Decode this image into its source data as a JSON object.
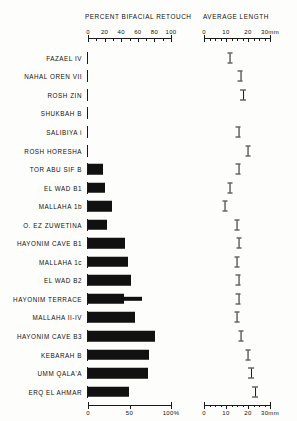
{
  "figure": {
    "left_panel_title": "PERCENT BIFACIAL RETOUCH",
    "right_panel_title": "AVERAGE LENGTH"
  },
  "chart_data": {
    "type": "bar",
    "title": "",
    "panels": [
      {
        "name": "percent-bifacial-retouch",
        "title": "PERCENT BIFACIAL RETOUCH",
        "xlabel": "",
        "xlim": [
          0,
          100
        ],
        "top_axis_ticks": [
          "0",
          "20",
          "40",
          "60",
          "80",
          "100"
        ],
        "top_axis_values": [
          0,
          20,
          40,
          60,
          80,
          100
        ],
        "bottom_axis_ticks": [
          "0",
          "50",
          "100%"
        ],
        "bottom_axis_values": [
          0,
          50,
          100
        ],
        "grid": false
      },
      {
        "name": "average-length",
        "title": "AVERAGE LENGTH",
        "xlabel": "mm",
        "xlim": [
          0,
          30
        ],
        "top_axis_ticks": [
          "0",
          "10",
          "20",
          "30mm"
        ],
        "top_axis_values": [
          0,
          10,
          20,
          30
        ],
        "bottom_axis_ticks": [
          "0",
          "10",
          "20",
          "30mm"
        ],
        "bottom_axis_values": [
          0,
          10,
          20,
          30
        ],
        "grid": false
      }
    ],
    "categories": [
      "FAZAEL IV",
      "NAHAL OREN VII",
      "ROSH ZIN",
      "SHUKBAH B",
      "SALIBIYA i",
      "ROSH HORESHA",
      "TOR ABU SIF B",
      "EL WAD B1",
      "MALLAHA 1b",
      "O. EZ ZUWETINA",
      "HAYONIM CAVE B1",
      "MALLAHA 1c",
      "EL WAD B2",
      "HAYONIM TERRACE",
      "MALLAHA II-IV",
      "HAYONIM CAVE B3",
      "KEBARAH B",
      "UMM QALA'A",
      "ERQ EL AHMAR"
    ],
    "series": [
      {
        "name": "Percent bifacial retouch",
        "unit": "%",
        "values": [
          0,
          0,
          0,
          0,
          0,
          0,
          18,
          21,
          29,
          23,
          44,
          48,
          52,
          43,
          57,
          81,
          74,
          72,
          49
        ],
        "extension_values": [
          null,
          null,
          null,
          null,
          null,
          null,
          null,
          null,
          null,
          null,
          null,
          null,
          null,
          65,
          null,
          null,
          null,
          null,
          null
        ]
      },
      {
        "name": "Average length",
        "unit": "mm",
        "values": [
          11.8,
          16.4,
          17.6,
          null,
          15.5,
          20.0,
          15.5,
          11.8,
          9.5,
          15.0,
          15.9,
          15.0,
          15.5,
          15.5,
          15.0,
          16.8,
          20.0,
          21.4,
          23.2
        ],
        "error_spans": [
          2.5,
          2.5,
          3.0,
          null,
          2.5,
          2.5,
          2.5,
          2.5,
          2.5,
          2.5,
          2.5,
          2.5,
          2.5,
          2.5,
          2.5,
          2.5,
          2.5,
          3.0,
          3.0
        ]
      }
    ]
  }
}
